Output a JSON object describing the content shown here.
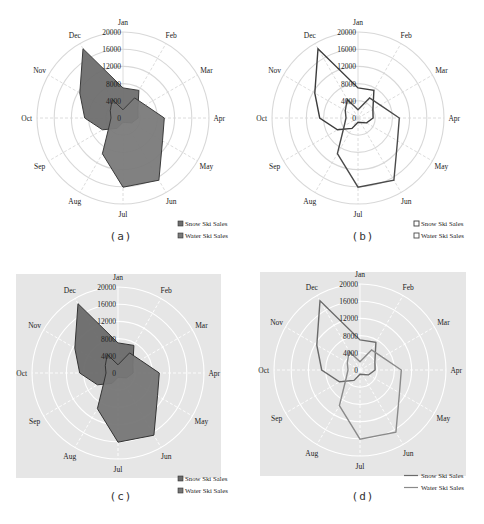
{
  "chart_data": [
    {
      "panel": "a",
      "type": "radar",
      "style": "filled",
      "background": "#ffffff",
      "grid_color": "#d8d8d8",
      "categories": [
        "Jan",
        "Feb",
        "Mar",
        "Apr",
        "May",
        "Jun",
        "Jul",
        "Aug",
        "Sep",
        "Oct",
        "Nov",
        "Dec"
      ],
      "radial_ticks": [
        0,
        4000,
        8000,
        12000,
        16000,
        20000
      ],
      "radial_range": [
        0,
        20000
      ],
      "series": [
        {
          "name": "Snow Ski Sales",
          "values": [
            7000,
            7400,
            4000,
            3500,
            2300,
            1200,
            1000,
            2800,
            5500,
            8900,
            11600,
            18600
          ],
          "fill": "#6e6e6e",
          "stroke": "#3a3a3a"
        },
        {
          "name": "Water Ski Sales",
          "values": [
            1900,
            5400,
            6000,
            9600,
            10600,
            16700,
            16100,
            9600,
            3700,
            2800,
            3400,
            5000
          ],
          "fill": "#7a7a7a",
          "stroke": "#3a3a3a"
        }
      ],
      "legend_position": "bottom-right",
      "caption": "(a)"
    },
    {
      "panel": "b",
      "type": "radar",
      "style": "line",
      "background": "#ffffff",
      "grid_color": "#d8d8d8",
      "categories": [
        "Jan",
        "Feb",
        "Mar",
        "Apr",
        "May",
        "Jun",
        "Jul",
        "Aug",
        "Sep",
        "Oct",
        "Nov",
        "Dec"
      ],
      "radial_ticks": [
        0,
        4000,
        8000,
        12000,
        16000,
        20000
      ],
      "radial_range": [
        0,
        20000
      ],
      "series": [
        {
          "name": "Snow Ski Sales",
          "values": [
            7000,
            7400,
            4000,
            3500,
            2300,
            1200,
            1000,
            2800,
            5500,
            8900,
            11600,
            18600
          ],
          "stroke": "#3c3c3c"
        },
        {
          "name": "Water Ski Sales",
          "values": [
            1900,
            5400,
            6000,
            9600,
            10600,
            16700,
            16100,
            9600,
            3700,
            2800,
            3400,
            5000
          ],
          "stroke": "#4a4a4a"
        }
      ],
      "legend_position": "bottom-right",
      "caption": "(b)"
    },
    {
      "panel": "c",
      "type": "radar",
      "style": "filled",
      "background": "#e6e6e6",
      "grid_color": "#ffffff",
      "categories": [
        "Jan",
        "Feb",
        "Mar",
        "Apr",
        "May",
        "Jun",
        "Jul",
        "Aug",
        "Sep",
        "Oct",
        "Nov",
        "Dec"
      ],
      "radial_ticks": [
        0,
        4000,
        8000,
        12000,
        16000,
        20000
      ],
      "radial_range": [
        0,
        20000
      ],
      "series": [
        {
          "name": "Snow Ski Sales",
          "values": [
            7000,
            7400,
            4000,
            3500,
            2300,
            1200,
            1000,
            2800,
            5500,
            8900,
            11600,
            18600
          ],
          "fill": "#6a6a6a",
          "stroke": "#333333"
        },
        {
          "name": "Water Ski Sales",
          "values": [
            1900,
            5400,
            6000,
            9600,
            10600,
            16700,
            16100,
            9600,
            3700,
            2800,
            3400,
            5000
          ],
          "fill": "#767676",
          "stroke": "#333333"
        }
      ],
      "legend_position": "bottom-right",
      "caption": "(c)"
    },
    {
      "panel": "d",
      "type": "radar",
      "style": "line",
      "background": "#e6e6e6",
      "grid_color": "#ffffff",
      "categories": [
        "Jan",
        "Feb",
        "Mar",
        "Apr",
        "May",
        "Jun",
        "Jul",
        "Aug",
        "Sep",
        "Oct",
        "Nov",
        "Dec"
      ],
      "radial_ticks": [
        0,
        4000,
        8000,
        12000,
        16000,
        20000
      ],
      "radial_range": [
        0,
        20000
      ],
      "series": [
        {
          "name": "Snow Ski Sales",
          "values": [
            7000,
            7400,
            4000,
            3500,
            2300,
            1200,
            1000,
            2800,
            5500,
            8900,
            11600,
            18600
          ],
          "stroke": "#6a6a6a"
        },
        {
          "name": "Water Ski Sales",
          "values": [
            1900,
            5400,
            6000,
            9600,
            10600,
            16700,
            16100,
            9600,
            3700,
            2800,
            3400,
            5000
          ],
          "stroke": "#8a8a8a"
        }
      ],
      "legend_position": "bottom-right",
      "caption": "(d)"
    }
  ],
  "layout": {
    "panels": [
      {
        "id": "a",
        "left": 0,
        "top": 0,
        "cx": 123,
        "cy": 118,
        "r": 86,
        "plot_bg": null
      },
      {
        "id": "b",
        "left": 242,
        "top": 0,
        "cx": 116,
        "cy": 118,
        "r": 86,
        "plot_bg": null
      },
      {
        "id": "c",
        "left": 0,
        "top": 262,
        "cx": 118,
        "cy": 111,
        "r": 86,
        "plot_bg": [
          16,
          12,
          205,
          204
        ]
      },
      {
        "id": "d",
        "left": 242,
        "top": 262,
        "cx": 118,
        "cy": 108,
        "r": 86,
        "plot_bg": [
          18,
          10,
          206,
          204
        ]
      }
    ]
  }
}
